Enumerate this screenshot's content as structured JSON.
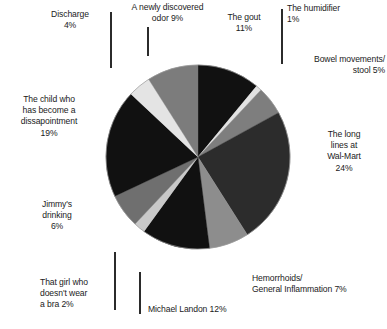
{
  "chart_data": {
    "type": "pie",
    "title": "",
    "subtitle": "",
    "xlabel": "",
    "ylabel": "",
    "legend_position": "callout-labels",
    "grid": false,
    "units": "percent",
    "total": 100,
    "categories": [
      "The gout",
      "The humidifier",
      "Bowel movements/ stool",
      "The long lines at Wal-Mart",
      "Hemorrhoids/ General Inflammation",
      "Michael Landon",
      "That girl who doesn't wear a bra",
      "Jimmy's drinking",
      "The child who has become a dissapointment",
      "Discharge",
      "A newly discovered odor"
    ],
    "values": [
      11,
      1,
      5,
      24,
      7,
      12,
      2,
      6,
      19,
      4,
      9
    ],
    "colors": [
      "#111111",
      "#e2e2e2",
      "#7e7e7e",
      "#2c2c2c",
      "#8d8d8d",
      "#111111",
      "#c9c9c9",
      "#6f6f6f",
      "#111111",
      "#e4e4e4",
      "#7c7c7c"
    ],
    "slices": [
      {
        "label": "The gout",
        "value": 11,
        "percent_text": "11%",
        "color": "#111111"
      },
      {
        "label": "The humidifier",
        "value": 1,
        "percent_text": "1%",
        "color": "#e2e2e2"
      },
      {
        "label": "Bowel movements/ stool",
        "value": 5,
        "percent_text": "5%",
        "color": "#7e7e7e"
      },
      {
        "label": "The long lines at Wal-Mart",
        "value": 24,
        "percent_text": "24%",
        "color": "#2c2c2c"
      },
      {
        "label": "Hemorrhoids/ General Inflammation",
        "value": 7,
        "percent_text": "7%",
        "color": "#8d8d8d"
      },
      {
        "label": "Michael Landon",
        "value": 12,
        "percent_text": "12%",
        "color": "#111111"
      },
      {
        "label": "That girl who doesn't wear a bra",
        "value": 2,
        "percent_text": "2%",
        "color": "#c9c9c9"
      },
      {
        "label": "Jimmy's drinking",
        "value": 6,
        "percent_text": "6%",
        "color": "#6f6f6f"
      },
      {
        "label": "The child who has become a dissapointment",
        "value": 19,
        "percent_text": "19%",
        "color": "#111111"
      },
      {
        "label": "Discharge",
        "value": 4,
        "percent_text": "4%",
        "color": "#e4e4e4"
      },
      {
        "label": "A newly discovered odor",
        "value": 9,
        "percent_text": "9%",
        "color": "#7c7c7c"
      }
    ]
  },
  "callouts": {
    "discharge": "Discharge\n4%",
    "odor": "A newly discovered\nodor   9%",
    "gout": "The gout\n11%",
    "humidifier": "The humidifier\n1%",
    "bowel": "Bowel movements/\nstool   5%",
    "walmart": "The long\nlines at\nWal-Mart\n24%",
    "hemorrhoids": "Hemorrhoids/\nGeneral Inflammation  7%",
    "michael_landon": "Michael Landon 12%",
    "bra": "That girl who\ndoesn't wear\na bra  2%",
    "jimmy": "Jimmy's\ndrinking\n6%",
    "child": "The child who\nhas become a\ndissapointment\n19%"
  }
}
